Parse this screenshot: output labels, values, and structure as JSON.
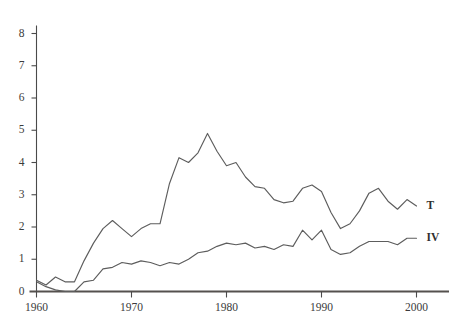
{
  "chart_data": {
    "type": "line",
    "title": "",
    "xlabel": "",
    "ylabel": "",
    "xlim": [
      1960,
      2000
    ],
    "ylim": [
      0,
      8
    ],
    "grid": false,
    "legend_position": "right-inline",
    "x_ticks": [
      1960,
      1970,
      1980,
      1990,
      2000
    ],
    "x_tick_labels": [
      "1960",
      "1970",
      "1980",
      "1990",
      "2000"
    ],
    "y_ticks": [
      0,
      1,
      2,
      3,
      4,
      5,
      6,
      7,
      8
    ],
    "y_tick_labels": [
      "0",
      "1",
      "2",
      "3",
      "4",
      "5",
      "6",
      "7",
      "8"
    ],
    "x": [
      1960,
      1961,
      1962,
      1963,
      1964,
      1965,
      1966,
      1967,
      1968,
      1969,
      1970,
      1971,
      1972,
      1973,
      1974,
      1975,
      1976,
      1977,
      1978,
      1979,
      1980,
      1981,
      1982,
      1983,
      1984,
      1985,
      1986,
      1987,
      1988,
      1989,
      1990,
      1991,
      1992,
      1993,
      1994,
      1995,
      1996,
      1997,
      1998,
      1999,
      2000
    ],
    "series": [
      {
        "name": "T",
        "label": "T",
        "color": "#5d5d5d",
        "values": [
          0.35,
          0.2,
          0.45,
          0.3,
          0.3,
          0.95,
          1.5,
          1.95,
          2.2,
          1.95,
          1.7,
          1.95,
          2.1,
          2.1,
          3.35,
          4.15,
          4.0,
          4.3,
          4.9,
          4.35,
          3.9,
          4.0,
          3.55,
          3.25,
          3.2,
          2.85,
          2.75,
          2.8,
          3.2,
          3.3,
          3.1,
          2.45,
          1.95,
          2.1,
          2.5,
          3.05,
          3.2,
          2.8,
          2.55,
          2.85,
          2.65
        ]
      },
      {
        "name": "IV",
        "label": "IV",
        "color": "#5d5d5d",
        "values": [
          0.3,
          0.15,
          0.05,
          0.0,
          0.0,
          0.3,
          0.35,
          0.7,
          0.75,
          0.9,
          0.85,
          0.95,
          0.9,
          0.8,
          0.9,
          0.85,
          1.0,
          1.2,
          1.25,
          1.4,
          1.5,
          1.45,
          1.5,
          1.35,
          1.4,
          1.3,
          1.45,
          1.4,
          1.9,
          1.6,
          1.9,
          1.3,
          1.15,
          1.2,
          1.4,
          1.55,
          1.55,
          1.55,
          1.45,
          1.65,
          1.65
        ]
      }
    ]
  }
}
